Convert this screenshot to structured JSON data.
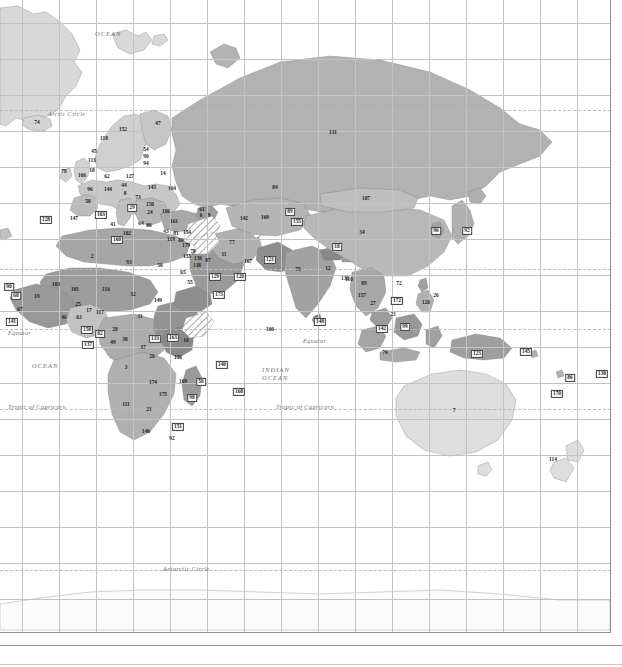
{
  "map": {
    "title": "World map with numbered country identifiers",
    "projection": "cylindrical",
    "colors": {
      "background": "#ffffff",
      "graticule": "#c2c2cc",
      "frame": "#8e8e8e",
      "special_latitude": "#d2b0b8",
      "label_text": "#6d6d6d",
      "number_text": "#1a1a1a",
      "fill_lightest": "#e8e8e8",
      "fill_light": "#dcdcdc",
      "fill_mid_light": "#cccccc",
      "fill_mid": "#b8b8b8",
      "fill_mid_dark": "#a8a8a8",
      "fill_dark": "#989898",
      "fill_darkest": "#888888"
    },
    "geo_labels": [
      {
        "id": "ocean-north-atlantic",
        "text": "OCEAN",
        "x": 95,
        "y": 30,
        "cls": "ocean-label"
      },
      {
        "id": "arctic-circle-left",
        "text": "Arctic Circle",
        "x": 48,
        "y": 110,
        "cls": ""
      },
      {
        "id": "equator-left",
        "text": "Equator",
        "x": 8,
        "y": 329,
        "cls": ""
      },
      {
        "id": "ocean-atlantic-south",
        "text": "OCEAN",
        "x": 32,
        "y": 362,
        "cls": "ocean-label"
      },
      {
        "id": "equator-right",
        "text": "Equator",
        "x": 303,
        "y": 337,
        "cls": ""
      },
      {
        "id": "indian-ocean-line1",
        "text": "INDIAN",
        "x": 262,
        "y": 366,
        "cls": "ocean-label"
      },
      {
        "id": "indian-ocean-line2",
        "text": "OCEAN",
        "x": 262,
        "y": 374,
        "cls": "ocean-label"
      },
      {
        "id": "tropic-capricorn-left",
        "text": "Tropic of Capricorn",
        "x": 8,
        "y": 403,
        "cls": ""
      },
      {
        "id": "tropic-capricorn-right",
        "text": "Tropic of Capricorn",
        "x": 276,
        "y": 403,
        "cls": ""
      },
      {
        "id": "antarctic-circle",
        "text": "Antarctic Circle",
        "x": 163,
        "y": 565,
        "cls": ""
      }
    ],
    "grid": {
      "vertical_x": [
        22,
        59,
        96,
        133,
        170,
        207,
        244,
        281,
        318,
        355,
        392,
        429,
        466,
        503,
        540,
        577
      ],
      "horizontal_y": [
        23,
        59,
        95,
        131,
        167,
        203,
        239,
        275,
        311,
        347,
        383,
        419,
        455,
        491,
        527,
        563,
        599
      ],
      "dashed_y": [
        110,
        269,
        329,
        409,
        570
      ]
    },
    "country_numbers": [
      {
        "n": "74",
        "x": 37,
        "y": 123,
        "boxed": false
      },
      {
        "n": "118",
        "x": 104,
        "y": 139,
        "boxed": false
      },
      {
        "n": "152",
        "x": 123,
        "y": 130,
        "boxed": false
      },
      {
        "n": "47",
        "x": 158,
        "y": 124,
        "boxed": false
      },
      {
        "n": "45",
        "x": 94,
        "y": 152,
        "boxed": false
      },
      {
        "n": "113",
        "x": 92,
        "y": 161,
        "boxed": false
      },
      {
        "n": "54",
        "x": 146,
        "y": 150,
        "boxed": false
      },
      {
        "n": "90",
        "x": 146,
        "y": 157,
        "boxed": false
      },
      {
        "n": "94",
        "x": 146,
        "y": 164,
        "boxed": false
      },
      {
        "n": "78",
        "x": 64,
        "y": 172,
        "boxed": false
      },
      {
        "n": "166",
        "x": 82,
        "y": 176,
        "boxed": false
      },
      {
        "n": "18",
        "x": 92,
        "y": 171,
        "boxed": false
      },
      {
        "n": "62",
        "x": 107,
        "y": 177,
        "boxed": false
      },
      {
        "n": "127",
        "x": 130,
        "y": 177,
        "boxed": false
      },
      {
        "n": "14",
        "x": 163,
        "y": 174,
        "boxed": false
      },
      {
        "n": "96",
        "x": 90,
        "y": 190,
        "boxed": false
      },
      {
        "n": "144",
        "x": 108,
        "y": 190,
        "boxed": false
      },
      {
        "n": "44",
        "x": 124,
        "y": 186,
        "boxed": false
      },
      {
        "n": "8",
        "x": 125,
        "y": 194,
        "boxed": false
      },
      {
        "n": "143",
        "x": 152,
        "y": 188,
        "boxed": false
      },
      {
        "n": "164",
        "x": 172,
        "y": 189,
        "boxed": false
      },
      {
        "n": "58",
        "x": 88,
        "y": 202,
        "boxed": false
      },
      {
        "n": "73",
        "x": 138,
        "y": 198,
        "boxed": false
      },
      {
        "n": "150",
        "x": 150,
        "y": 205,
        "boxed": false
      },
      {
        "n": "29",
        "x": 132,
        "y": 208,
        "boxed": true
      },
      {
        "n": "24",
        "x": 150,
        "y": 213,
        "boxed": false
      },
      {
        "n": "106",
        "x": 166,
        "y": 212,
        "boxed": false
      },
      {
        "n": "128",
        "x": 46,
        "y": 220,
        "boxed": true
      },
      {
        "n": "147",
        "x": 74,
        "y": 219,
        "boxed": false
      },
      {
        "n": "103",
        "x": 101,
        "y": 215,
        "boxed": true
      },
      {
        "n": "41",
        "x": 113,
        "y": 225,
        "boxed": false
      },
      {
        "n": "64",
        "x": 141,
        "y": 224,
        "boxed": false
      },
      {
        "n": "86",
        "x": 149,
        "y": 226,
        "boxed": false
      },
      {
        "n": "102",
        "x": 127,
        "y": 234,
        "boxed": false
      },
      {
        "n": "160",
        "x": 117,
        "y": 240,
        "boxed": true
      },
      {
        "n": "161",
        "x": 174,
        "y": 222,
        "boxed": false
      },
      {
        "n": "43",
        "x": 166,
        "y": 232,
        "boxed": false
      },
      {
        "n": "81",
        "x": 176,
        "y": 234,
        "boxed": false
      },
      {
        "n": "154",
        "x": 187,
        "y": 233,
        "boxed": false
      },
      {
        "n": "119",
        "x": 171,
        "y": 240,
        "boxed": false
      },
      {
        "n": "80",
        "x": 181,
        "y": 241,
        "boxed": false
      },
      {
        "n": "179",
        "x": 186,
        "y": 246,
        "boxed": false
      },
      {
        "n": "61",
        "x": 202,
        "y": 210,
        "boxed": false
      },
      {
        "n": "6",
        "x": 201,
        "y": 216,
        "boxed": false
      },
      {
        "n": "9",
        "x": 209,
        "y": 216,
        "boxed": false
      },
      {
        "n": "142",
        "x": 244,
        "y": 219,
        "boxed": false
      },
      {
        "n": "169",
        "x": 265,
        "y": 218,
        "boxed": false
      },
      {
        "n": "89",
        "x": 290,
        "y": 212,
        "boxed": true
      },
      {
        "n": "155",
        "x": 297,
        "y": 222,
        "boxed": true
      },
      {
        "n": "84",
        "x": 275,
        "y": 188,
        "boxed": false
      },
      {
        "n": "107",
        "x": 366,
        "y": 199,
        "boxed": false
      },
      {
        "n": "131",
        "x": 333,
        "y": 133,
        "boxed": false
      },
      {
        "n": "34",
        "x": 362,
        "y": 233,
        "boxed": false
      },
      {
        "n": "96",
        "x": 436,
        "y": 231,
        "boxed": true
      },
      {
        "n": "92",
        "x": 467,
        "y": 231,
        "boxed": true
      },
      {
        "n": "77",
        "x": 232,
        "y": 243,
        "boxed": false
      },
      {
        "n": "11",
        "x": 224,
        "y": 255,
        "boxed": false
      },
      {
        "n": "87",
        "x": 208,
        "y": 261,
        "boxed": false
      },
      {
        "n": "138",
        "x": 197,
        "y": 266,
        "boxed": false
      },
      {
        "n": "129",
        "x": 215,
        "y": 277,
        "boxed": true
      },
      {
        "n": "120",
        "x": 240,
        "y": 277,
        "boxed": true
      },
      {
        "n": "167",
        "x": 248,
        "y": 262,
        "boxed": false
      },
      {
        "n": "121",
        "x": 270,
        "y": 260,
        "boxed": true
      },
      {
        "n": "173",
        "x": 219,
        "y": 295,
        "boxed": true
      },
      {
        "n": "75",
        "x": 298,
        "y": 270,
        "boxed": false
      },
      {
        "n": "12",
        "x": 328,
        "y": 269,
        "boxed": false
      },
      {
        "n": "18",
        "x": 337,
        "y": 247,
        "boxed": true
      },
      {
        "n": "130",
        "x": 345,
        "y": 279,
        "boxed": false
      },
      {
        "n": "89",
        "x": 364,
        "y": 284,
        "boxed": false
      },
      {
        "n": "157",
        "x": 362,
        "y": 296,
        "boxed": false
      },
      {
        "n": "27",
        "x": 373,
        "y": 304,
        "boxed": false
      },
      {
        "n": "172",
        "x": 397,
        "y": 301,
        "boxed": true
      },
      {
        "n": "72",
        "x": 399,
        "y": 284,
        "boxed": false
      },
      {
        "n": "23",
        "x": 393,
        "y": 315,
        "boxed": false
      },
      {
        "n": "26",
        "x": 436,
        "y": 296,
        "boxed": false
      },
      {
        "n": "142",
        "x": 382,
        "y": 329,
        "boxed": true
      },
      {
        "n": "99",
        "x": 405,
        "y": 327,
        "boxed": true
      },
      {
        "n": "76",
        "x": 385,
        "y": 353,
        "boxed": false
      },
      {
        "n": "123",
        "x": 477,
        "y": 354,
        "boxed": true
      },
      {
        "n": "148",
        "x": 320,
        "y": 322,
        "boxed": true
      },
      {
        "n": "145",
        "x": 526,
        "y": 352,
        "boxed": true
      },
      {
        "n": "86",
        "x": 570,
        "y": 378,
        "boxed": true
      },
      {
        "n": "170",
        "x": 557,
        "y": 394,
        "boxed": true
      },
      {
        "n": "138",
        "x": 602,
        "y": 374,
        "boxed": true
      },
      {
        "n": "7",
        "x": 454,
        "y": 411,
        "boxed": false
      },
      {
        "n": "114",
        "x": 553,
        "y": 460,
        "boxed": false
      },
      {
        "n": "100",
        "x": 270,
        "y": 330,
        "boxed": false
      },
      {
        "n": "2",
        "x": 92,
        "y": 257,
        "boxed": false
      },
      {
        "n": "93",
        "x": 129,
        "y": 263,
        "boxed": false
      },
      {
        "n": "50",
        "x": 160,
        "y": 266,
        "boxed": false
      },
      {
        "n": "135",
        "x": 187,
        "y": 257,
        "boxed": false
      },
      {
        "n": "79",
        "x": 193,
        "y": 252,
        "boxed": false
      },
      {
        "n": "136",
        "x": 198,
        "y": 259,
        "boxed": false
      },
      {
        "n": "55",
        "x": 190,
        "y": 283,
        "boxed": false
      },
      {
        "n": "65",
        "x": 183,
        "y": 273,
        "boxed": false
      },
      {
        "n": "90",
        "x": 9,
        "y": 287,
        "boxed": true
      },
      {
        "n": "19",
        "x": 37,
        "y": 297,
        "boxed": false
      },
      {
        "n": "68",
        "x": 16,
        "y": 296,
        "boxed": true
      },
      {
        "n": "67",
        "x": 20,
        "y": 310,
        "boxed": false
      },
      {
        "n": "141",
        "x": 12,
        "y": 322,
        "boxed": true
      },
      {
        "n": "103",
        "x": 56,
        "y": 285,
        "boxed": false
      },
      {
        "n": "101",
        "x": 75,
        "y": 290,
        "boxed": false
      },
      {
        "n": "116",
        "x": 106,
        "y": 290,
        "boxed": false
      },
      {
        "n": "32",
        "x": 133,
        "y": 295,
        "boxed": false
      },
      {
        "n": "149",
        "x": 158,
        "y": 301,
        "boxed": false
      },
      {
        "n": "25",
        "x": 78,
        "y": 305,
        "boxed": false
      },
      {
        "n": "117",
        "x": 100,
        "y": 313,
        "boxed": false
      },
      {
        "n": "46",
        "x": 64,
        "y": 318,
        "boxed": false
      },
      {
        "n": "63",
        "x": 79,
        "y": 318,
        "boxed": false
      },
      {
        "n": "17",
        "x": 89,
        "y": 311,
        "boxed": false
      },
      {
        "n": "31",
        "x": 140,
        "y": 317,
        "boxed": false
      },
      {
        "n": "28",
        "x": 115,
        "y": 330,
        "boxed": false
      },
      {
        "n": "158",
        "x": 87,
        "y": 330,
        "boxed": true
      },
      {
        "n": "82",
        "x": 100,
        "y": 334,
        "boxed": true
      },
      {
        "n": "137",
        "x": 88,
        "y": 345,
        "boxed": true
      },
      {
        "n": "49",
        "x": 113,
        "y": 343,
        "boxed": false
      },
      {
        "n": "38",
        "x": 125,
        "y": 340,
        "boxed": false
      },
      {
        "n": "133",
        "x": 155,
        "y": 339,
        "boxed": true
      },
      {
        "n": "163",
        "x": 173,
        "y": 338,
        "boxed": true
      },
      {
        "n": "10",
        "x": 186,
        "y": 341,
        "boxed": false
      },
      {
        "n": "37",
        "x": 143,
        "y": 348,
        "boxed": false
      },
      {
        "n": "20",
        "x": 152,
        "y": 357,
        "boxed": false
      },
      {
        "n": "156",
        "x": 178,
        "y": 358,
        "boxed": false
      },
      {
        "n": "3",
        "x": 126,
        "y": 368,
        "boxed": false
      },
      {
        "n": "174",
        "x": 153,
        "y": 383,
        "boxed": false
      },
      {
        "n": "169",
        "x": 183,
        "y": 382,
        "boxed": false
      },
      {
        "n": "56",
        "x": 201,
        "y": 382,
        "boxed": true
      },
      {
        "n": "175",
        "x": 163,
        "y": 395,
        "boxed": false
      },
      {
        "n": "98",
        "x": 192,
        "y": 398,
        "boxed": true
      },
      {
        "n": "111",
        "x": 126,
        "y": 405,
        "boxed": false
      },
      {
        "n": "21",
        "x": 149,
        "y": 410,
        "boxed": false
      },
      {
        "n": "151",
        "x": 178,
        "y": 427,
        "boxed": true
      },
      {
        "n": "146",
        "x": 146,
        "y": 432,
        "boxed": false
      },
      {
        "n": "92",
        "x": 172,
        "y": 439,
        "boxed": false
      },
      {
        "n": "140",
        "x": 222,
        "y": 365,
        "boxed": true
      },
      {
        "n": "168",
        "x": 239,
        "y": 392,
        "boxed": true
      },
      {
        "n": "126",
        "x": 426,
        "y": 303,
        "boxed": false
      },
      {
        "n": "110",
        "x": 349,
        "y": 280,
        "boxed": false
      }
    ]
  }
}
